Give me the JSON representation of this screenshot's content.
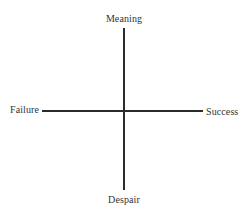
{
  "diagram": {
    "type": "quadrant-axes",
    "axes": {
      "vertical": {
        "top_label": "Meaning",
        "bottom_label": "Despair"
      },
      "horizontal": {
        "left_label": "Failure",
        "right_label": "Success"
      }
    },
    "colors": {
      "line": "#2b2b2b",
      "text": "#333333",
      "background": "#ffffff"
    }
  }
}
